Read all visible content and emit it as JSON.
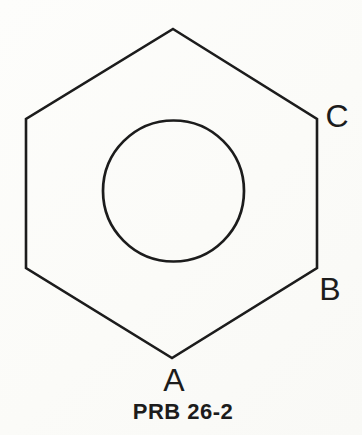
{
  "diagram": {
    "caption": "PRB 26-2",
    "vertex_labels": {
      "A": "A",
      "B": "B",
      "C": "C"
    },
    "shapes": {
      "outer": "hexagon",
      "inner": "circle"
    },
    "colors": {
      "line": "#1c1c1c",
      "text": "#1c1c1c",
      "background": "#fcfcfa"
    }
  }
}
